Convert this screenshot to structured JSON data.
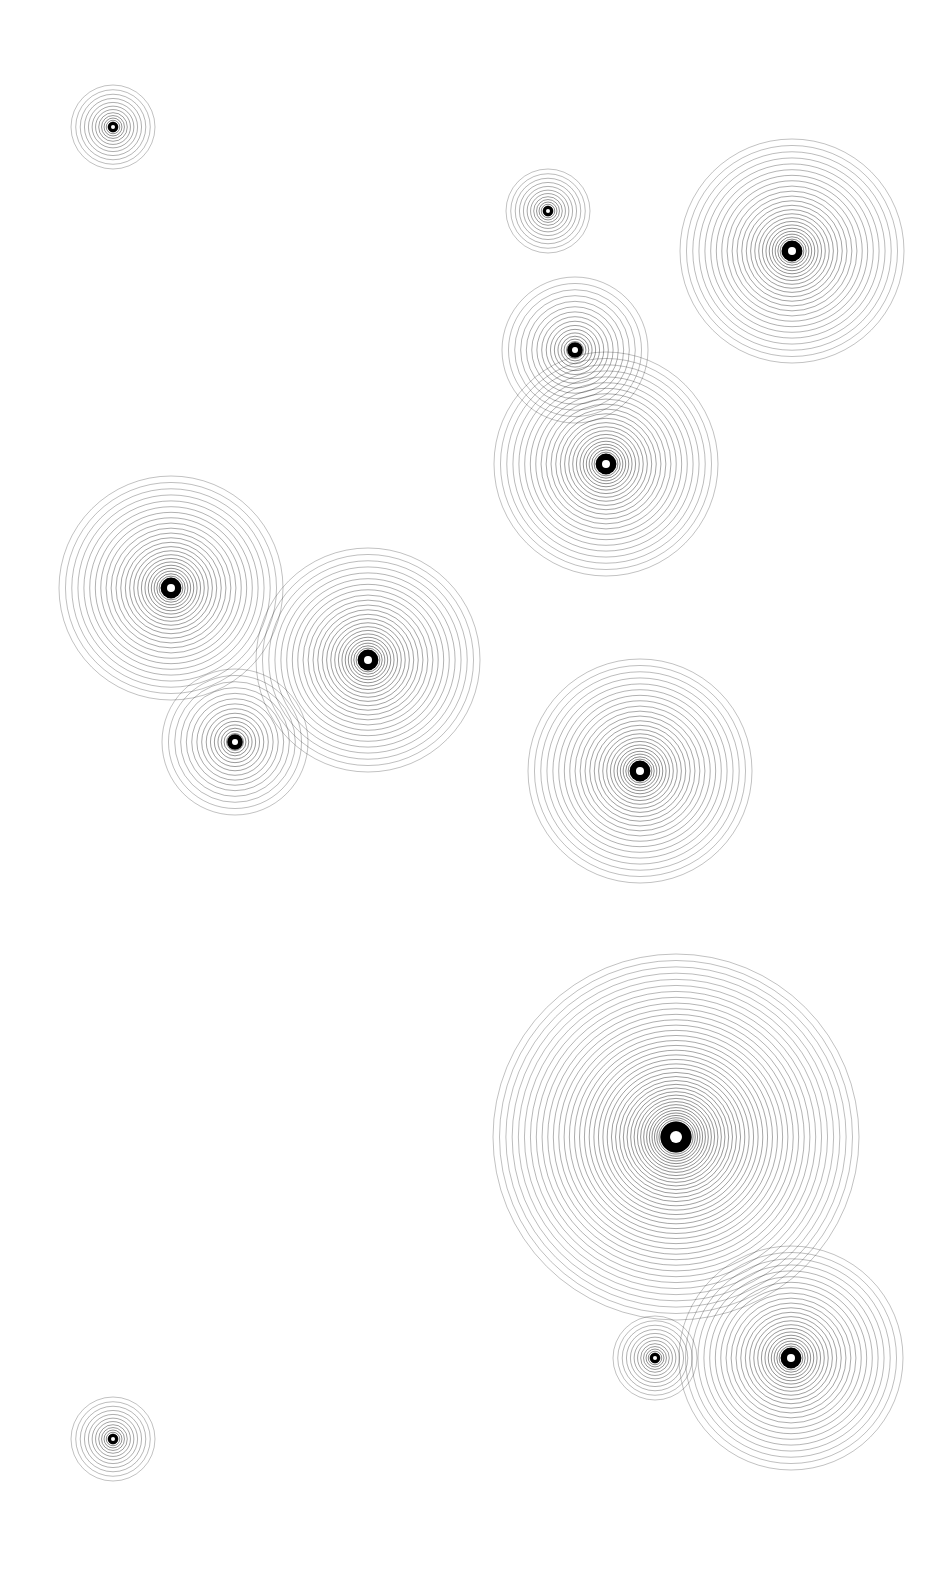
{
  "artwork": {
    "background": "#ffffff",
    "ring_color": "#000000",
    "width": 948,
    "height": 1587,
    "groups": [
      {
        "cx": 113,
        "cy": 127,
        "r": 42,
        "hole": 2
      },
      {
        "cx": 548,
        "cy": 211,
        "r": 42,
        "hole": 2
      },
      {
        "cx": 792,
        "cy": 251,
        "r": 112,
        "hole": 4
      },
      {
        "cx": 575,
        "cy": 350,
        "r": 73,
        "hole": 3
      },
      {
        "cx": 606,
        "cy": 464,
        "r": 112,
        "hole": 4
      },
      {
        "cx": 171,
        "cy": 588,
        "r": 112,
        "hole": 4
      },
      {
        "cx": 368,
        "cy": 660,
        "r": 112,
        "hole": 4
      },
      {
        "cx": 235,
        "cy": 742,
        "r": 73,
        "hole": 3
      },
      {
        "cx": 640,
        "cy": 771,
        "r": 112,
        "hole": 4
      },
      {
        "cx": 676,
        "cy": 1137,
        "r": 183,
        "hole": 6
      },
      {
        "cx": 655,
        "cy": 1358,
        "r": 42,
        "hole": 2
      },
      {
        "cx": 791,
        "cy": 1358,
        "r": 112,
        "hole": 4
      },
      {
        "cx": 113,
        "cy": 1439,
        "r": 42,
        "hole": 2
      }
    ]
  }
}
